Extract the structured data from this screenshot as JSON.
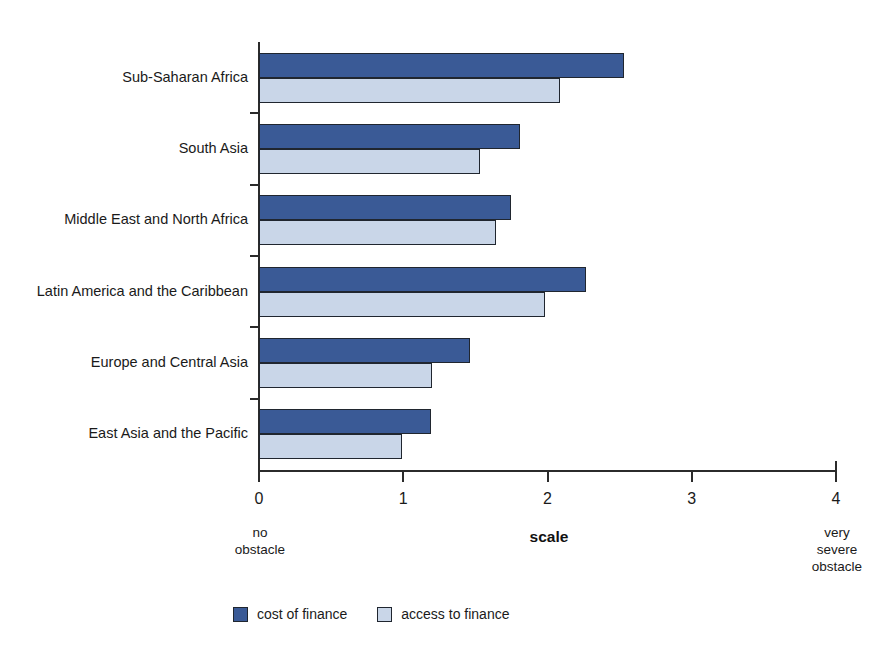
{
  "chart_data": {
    "type": "bar",
    "orientation": "horizontal",
    "title": "",
    "xlabel": "scale",
    "ylabel": "",
    "xlim": [
      0,
      4
    ],
    "xticks": [
      "0",
      "1",
      "2",
      "3",
      "4"
    ],
    "grid": false,
    "legend_position": "bottom",
    "categories": [
      "Sub-Saharan Africa",
      "South Asia",
      "Middle East and North Africa",
      "Latin America and the Caribbean",
      "Europe and Central Asia",
      "East Asia and the Pacific"
    ],
    "series": [
      {
        "name": "cost of finance",
        "color": "#3a5a96",
        "values": [
          2.53,
          1.81,
          1.75,
          2.27,
          1.46,
          1.19
        ]
      },
      {
        "name": "access to finance",
        "color": "#c9d6e8",
        "values": [
          2.09,
          1.53,
          1.64,
          1.98,
          1.2,
          0.99
        ]
      }
    ],
    "annotations": {
      "axis_low": "no\nobstacle",
      "axis_low_line1": "no",
      "axis_low_line2": "obstacle",
      "axis_high_line1": "very",
      "axis_high_line2": "severe",
      "axis_high_line3": "obstacle"
    }
  },
  "axis": {
    "scale_label": "scale",
    "low_note_line1": "no",
    "low_note_line2": "obstacle",
    "high_note_line1": "very",
    "high_note_line2": "severe",
    "high_note_line3": "obstacle"
  },
  "legend": {
    "items": [
      {
        "label": "cost of finance",
        "color": "#3a5a96"
      },
      {
        "label": "access to finance",
        "color": "#c9d6e8"
      }
    ]
  },
  "footer": {
    "source": ""
  },
  "colors": {
    "cost_of_finance": "#3a5a96",
    "access_to_finance": "#c9d6e8",
    "axis": "#2b2b2b",
    "text": "#1a1a1a",
    "background": "#ffffff"
  }
}
